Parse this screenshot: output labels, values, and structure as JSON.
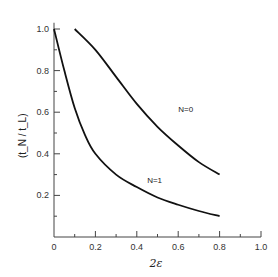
{
  "chart_data": {
    "type": "line",
    "title": "",
    "xlabel": "2ε",
    "ylabel": "(t_N / t_L)",
    "xlim": [
      0,
      1.0
    ],
    "ylim": [
      0,
      1.05
    ],
    "xticks": [
      0,
      0.2,
      0.4,
      0.6,
      0.8,
      1.0
    ],
    "xtick_labels": [
      "0",
      "0.2",
      "0.4",
      "0.6",
      "0.8",
      "1.0"
    ],
    "yticks": [
      0.2,
      0.4,
      0.6,
      0.8,
      1.0
    ],
    "ytick_labels": [
      "0.2",
      "0.4",
      "0.6",
      "0.8",
      "1.0"
    ],
    "grid": false,
    "legend": "none (inline annotations)",
    "series": [
      {
        "name": "N=0",
        "x": [
          0.1,
          0.2,
          0.3,
          0.4,
          0.5,
          0.6,
          0.7,
          0.8
        ],
        "y": [
          1.0,
          0.9,
          0.77,
          0.64,
          0.53,
          0.44,
          0.36,
          0.3
        ]
      },
      {
        "name": "N=1",
        "x": [
          0.0,
          0.05,
          0.1,
          0.15,
          0.2,
          0.3,
          0.4,
          0.5,
          0.6,
          0.7,
          0.8
        ],
        "y": [
          1.0,
          0.8,
          0.62,
          0.49,
          0.4,
          0.3,
          0.24,
          0.19,
          0.155,
          0.125,
          0.1
        ]
      }
    ],
    "annotations": [
      {
        "text": "N=0",
        "x": 0.6,
        "y": 0.6
      },
      {
        "text": "N=1",
        "x": 0.45,
        "y": 0.26
      }
    ]
  }
}
